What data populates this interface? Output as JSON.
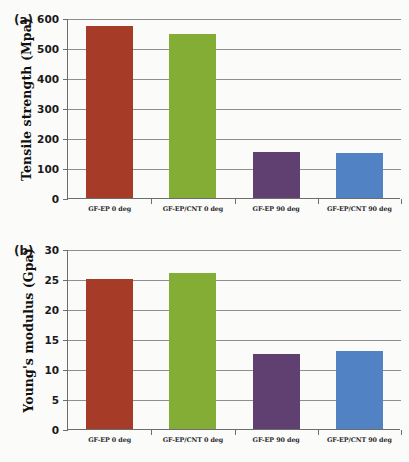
{
  "figure": {
    "background_color": "#fbfbfa",
    "bar_colors": {
      "gf_ep_0": "#A63C28",
      "gf_ep_cnt_0": "#84AD36",
      "gf_ep_90": "#604070",
      "gf_ep_cnt_90": "#5183C4"
    },
    "axis_color": "#6d6d6d",
    "grid_color": "#8f8f8f"
  },
  "panels": [
    {
      "label": "(a)",
      "chart_data": {
        "type": "bar",
        "title": "",
        "xlabel": "",
        "ylabel": "Tensile strength (Mpa)",
        "categories": [
          "GF-EP 0 deg",
          "GF-EP/CNT 0 deg",
          "GF-EP 90 deg",
          "GF-EP/CNT 90 deg"
        ],
        "values": [
          575,
          548,
          152,
          150
        ],
        "colors": [
          "#A63C28",
          "#84AD36",
          "#604070",
          "#5183C4"
        ],
        "ylim": [
          0,
          600
        ],
        "yticks": [
          0,
          100,
          200,
          300,
          400,
          500,
          600
        ],
        "ytick_labels": [
          "0",
          "100",
          "200",
          "300",
          "400",
          "500",
          "600"
        ],
        "grid": true,
        "legend": "none"
      }
    },
    {
      "label": "(b)",
      "chart_data": {
        "type": "bar",
        "title": "",
        "xlabel": "",
        "ylabel": "Young's modulus (Gpa)",
        "categories": [
          "GF-EP 0 deg",
          "GF-EP/CNT 0 deg",
          "GF-EP 90 deg",
          "GF-EP/CNT 90 deg"
        ],
        "values": [
          25,
          26,
          12.5,
          13
        ],
        "colors": [
          "#A63C28",
          "#84AD36",
          "#604070",
          "#5183C4"
        ],
        "ylim": [
          0,
          30
        ],
        "yticks": [
          0,
          5,
          10,
          15,
          20,
          25,
          30
        ],
        "ytick_labels": [
          "0",
          "5",
          "10",
          "15",
          "20",
          "25",
          "30"
        ],
        "grid": true,
        "legend": "none"
      }
    }
  ]
}
